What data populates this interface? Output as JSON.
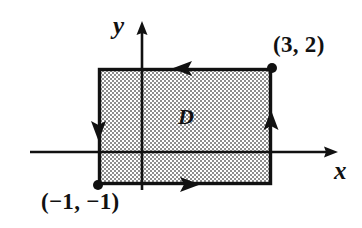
{
  "figure": {
    "type": "coordinate-plane-diagram",
    "background_color": "#ffffff",
    "ink_color": "#111111"
  },
  "axes": {
    "x_axis": {
      "label": "x",
      "line_y": 152,
      "x_start": 30,
      "x_end": 338,
      "arrow": "right"
    },
    "y_axis": {
      "label": "y",
      "line_x": 142,
      "y_start": 22,
      "y_end": 190,
      "arrow": "up"
    }
  },
  "region": {
    "label": "D",
    "fill_style": "checkerboard-dither",
    "fill_color": "#9a9a9a",
    "border_color": "#111111",
    "border_width": 3,
    "pixel_bounds": {
      "left": 98,
      "top": 68,
      "right": 272,
      "bottom": 185
    },
    "math_bounds": {
      "x_min": -1,
      "x_max": 3,
      "y_min": -1,
      "y_max": 2
    }
  },
  "vertices": [
    {
      "name": "top-right",
      "label": "(3, 2)",
      "x": 272,
      "y": 68,
      "dot": true
    },
    {
      "name": "bottom-left",
      "label": "(−1, −1)",
      "x": 98,
      "y": 185,
      "dot": true
    }
  ],
  "orientation": {
    "name": "counterclockwise",
    "arrows": [
      {
        "edge": "top",
        "direction": "left",
        "x": 186,
        "y": 68
      },
      {
        "edge": "right",
        "direction": "up",
        "x": 272,
        "y": 124
      },
      {
        "edge": "bottom",
        "direction": "right",
        "x": 186,
        "y": 185
      },
      {
        "edge": "left",
        "direction": "down",
        "x": 98,
        "y": 127
      }
    ]
  }
}
